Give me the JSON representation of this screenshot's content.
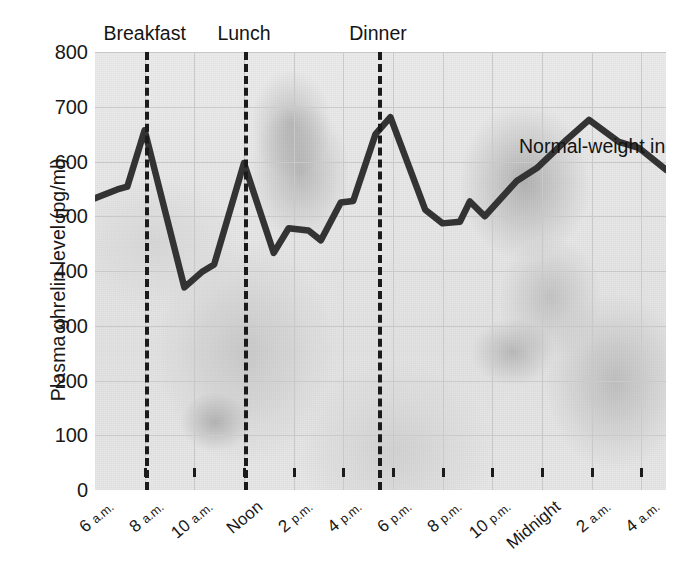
{
  "chart_data": {
    "type": "line",
    "title": "",
    "xlabel": "",
    "ylabel": "Plasma ghrelin level (pg/ml)",
    "ylim": [
      0,
      800
    ],
    "ytick_values": [
      0,
      100,
      200,
      300,
      400,
      500,
      600,
      700,
      800
    ],
    "xtick_labels": [
      "6 a.m.",
      "8 a.m.",
      "10 a.m.",
      "Noon",
      "2 p.m.",
      "4 p.m.",
      "6 p.m.",
      "8 p.m.",
      "10 p.m.",
      "Midnight",
      "2 a.m.",
      "4 a.m."
    ],
    "xtick_hours": [
      6,
      8,
      10,
      12,
      14,
      16,
      18,
      20,
      22,
      24,
      26,
      28
    ],
    "xlim_hours": [
      6,
      29
    ],
    "grid": true,
    "legend_position": "inline-annotation",
    "series": [
      {
        "name": "Normal-weight individuals",
        "color": "#333333",
        "points": [
          {
            "hour": 6.0,
            "value": 533
          },
          {
            "hour": 6.9,
            "value": 549
          },
          {
            "hour": 7.3,
            "value": 554
          },
          {
            "hour": 8.0,
            "value": 657
          },
          {
            "hour": 9.6,
            "value": 370
          },
          {
            "hour": 10.3,
            "value": 398
          },
          {
            "hour": 10.8,
            "value": 412
          },
          {
            "hour": 12.0,
            "value": 597
          },
          {
            "hour": 13.2,
            "value": 433
          },
          {
            "hour": 13.8,
            "value": 478
          },
          {
            "hour": 14.6,
            "value": 474
          },
          {
            "hour": 15.1,
            "value": 456
          },
          {
            "hour": 15.9,
            "value": 525
          },
          {
            "hour": 16.4,
            "value": 528
          },
          {
            "hour": 17.3,
            "value": 650
          },
          {
            "hour": 17.9,
            "value": 681
          },
          {
            "hour": 19.3,
            "value": 512
          },
          {
            "hour": 20.0,
            "value": 487
          },
          {
            "hour": 20.7,
            "value": 490
          },
          {
            "hour": 21.1,
            "value": 527
          },
          {
            "hour": 21.7,
            "value": 500
          },
          {
            "hour": 23.0,
            "value": 565
          },
          {
            "hour": 23.8,
            "value": 588
          },
          {
            "hour": 25.0,
            "value": 640
          },
          {
            "hour": 25.9,
            "value": 676
          },
          {
            "hour": 27.1,
            "value": 636
          },
          {
            "hour": 27.9,
            "value": 625
          },
          {
            "hour": 29.0,
            "value": 585
          }
        ]
      }
    ],
    "annotations": [
      {
        "label": "Breakfast",
        "hour": 8.0,
        "style": "vertical-dashed"
      },
      {
        "label": "Lunch",
        "hour": 12.0,
        "style": "vertical-dashed"
      },
      {
        "label": "Dinner",
        "hour": 17.4,
        "style": "vertical-dashed"
      }
    ],
    "series_annotation": "Normal-weight individuals"
  }
}
